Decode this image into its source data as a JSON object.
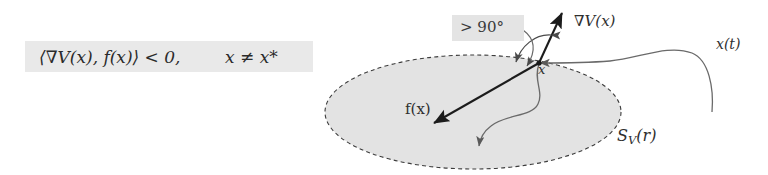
{
  "formula": {
    "inner_product": "⟨∇V(x), f(x)⟩ < 0,",
    "condition": "x ≠ x*"
  },
  "diagram": {
    "angle_label": "> 90°",
    "gradient_label": "∇V(x)",
    "vector_field_label": "f(x)",
    "trajectory_label": "x(t)",
    "sublevel_set_label_base": "S",
    "sublevel_set_label_sub": "V",
    "sublevel_set_label_arg": "(r)",
    "point_label": "x",
    "colors": {
      "ellipse_fill": "#e3e3e3",
      "ellipse_stroke": "#3c3c3c",
      "arrow_stroke": "#1c1c1c",
      "curve_stroke": "#555555",
      "highlight_bg": "#e9e9e9",
      "text": "#2b2b2b"
    }
  }
}
